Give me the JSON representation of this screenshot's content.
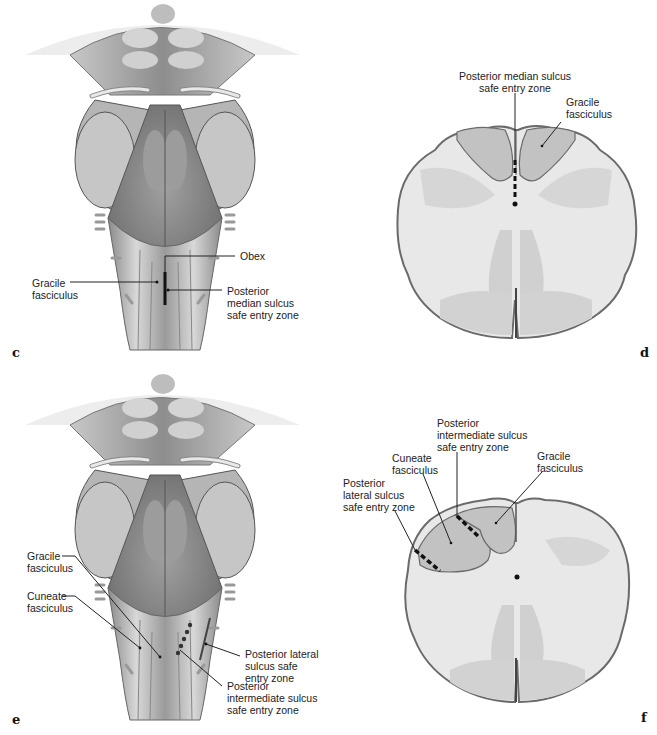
{
  "figure": {
    "panels": [
      {
        "id": "c",
        "view": "posterior brainstem",
        "panel_label": "c",
        "labels": {
          "obex": "Obex",
          "gracile": "Gracile\nfasciculus",
          "pms": "Posterior\nmedian sulcus\nsafe entry zone"
        }
      },
      {
        "id": "d",
        "view": "axial medulla section",
        "panel_label": "d",
        "labels": {
          "pms": "Posterior median sulcus\nsafe entry zone",
          "gracile": "Gracile\nfasciculus"
        }
      },
      {
        "id": "e",
        "view": "posterior brainstem",
        "panel_label": "e",
        "labels": {
          "gracile": "Gracile\nfasciculus",
          "cuneate": "Cuneate\nfasciculus",
          "pls": "Posterior lateral\nsulcus safe\nentry zone",
          "pis": "Posterior\nintermediate sulcus\nsafe entry zone"
        }
      },
      {
        "id": "f",
        "view": "axial medulla section",
        "panel_label": "f",
        "labels": {
          "pis": "Posterior\nintermediate sulcus\nsafe entry zone",
          "cuneate": "Cuneate\nfasciculus",
          "gracile": "Gracile\nfasciculus",
          "pls": "Posterior\nlateral sulcus\nsafe entry zone"
        }
      }
    ],
    "colors": {
      "background": "#ffffff",
      "tissue_light": "#e6e6e6",
      "tissue_mid": "#b8b8b8",
      "tissue_dark": "#7a7a7a",
      "fasciculus_shade": "#c4c4c4",
      "outline": "#6a6a6a",
      "text": "#222222"
    }
  }
}
